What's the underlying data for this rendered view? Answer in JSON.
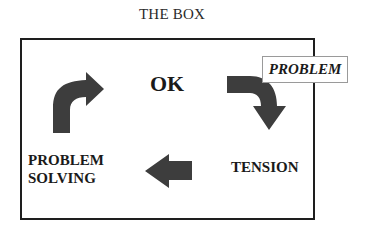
{
  "diagram": {
    "title": "THE BOX",
    "box_border_color": "#1e1e1e",
    "arrow_color": "#3d3d3d",
    "nodes": {
      "ok": "OK",
      "problem": "PROBLEM",
      "tension": "TENSION",
      "problem_solving_line1": "PROBLEM",
      "problem_solving_line2": "SOLVING"
    },
    "arrows": [
      {
        "from": "OK",
        "to": "TENSION",
        "shape": "curved-right-down",
        "icon": "curved-arrow-down-icon"
      },
      {
        "from": "TENSION",
        "to": "PROBLEM SOLVING",
        "shape": "straight-left",
        "icon": "arrow-left-icon"
      },
      {
        "from": "PROBLEM SOLVING",
        "to": "OK",
        "shape": "curved-up-right",
        "icon": "curved-arrow-up-right-icon"
      }
    ],
    "cycle": [
      "OK",
      "TENSION",
      "PROBLEM SOLVING",
      "OK"
    ],
    "external_trigger": "PROBLEM"
  }
}
